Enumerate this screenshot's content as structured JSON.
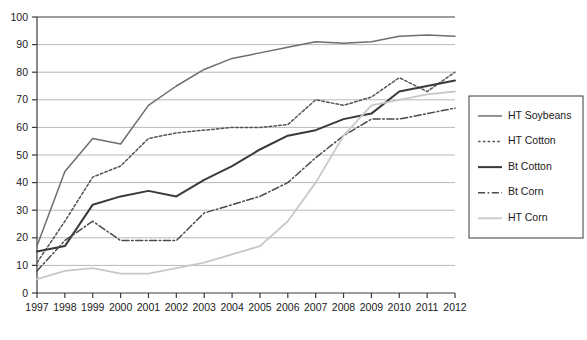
{
  "chart_data": {
    "type": "line",
    "title": "",
    "subtitle": "",
    "xlabel": "",
    "ylabel": "",
    "x": [
      1997,
      1998,
      1999,
      2000,
      2001,
      2002,
      2003,
      2004,
      2005,
      2006,
      2007,
      2008,
      2009,
      2010,
      2011,
      2012
    ],
    "xlim": [
      1997,
      2012
    ],
    "ylim": [
      0,
      100
    ],
    "y_ticks": [
      0,
      10,
      20,
      30,
      40,
      50,
      60,
      70,
      80,
      90,
      100
    ],
    "x_tick_labels": [
      "1997",
      "1998",
      "1999",
      "2000",
      "2001",
      "2002",
      "2003",
      "2004",
      "2005",
      "2006",
      "2007",
      "2008",
      "2009",
      "2010",
      "2011",
      "2012"
    ],
    "y_tick_labels": [
      "0",
      "10",
      "20",
      "30",
      "40",
      "50",
      "60",
      "70",
      "80",
      "90",
      "100"
    ],
    "grid": true,
    "grid_axis": "y",
    "legend_position": "right",
    "series": [
      {
        "name": "HT Soybeans",
        "style": "solid",
        "color": "#6e6e6e",
        "width": 1.5,
        "values": [
          17,
          44,
          56,
          54,
          68,
          75,
          81,
          85,
          87,
          89,
          91,
          90.5,
          91,
          93,
          93.5,
          93
        ]
      },
      {
        "name": "HT Cotton",
        "style": "dotted",
        "color": "#555555",
        "width": 1.5,
        "values": [
          11,
          26,
          42,
          46,
          56,
          58,
          59,
          60,
          60,
          61,
          70,
          68,
          71,
          78,
          73,
          80
        ]
      },
      {
        "name": "Bt Cotton",
        "style": "solid",
        "color": "#3a3a3a",
        "width": 2,
        "values": [
          15,
          17,
          32,
          35,
          37,
          35,
          41,
          46,
          52,
          57,
          59,
          63,
          65,
          73,
          75,
          77
        ]
      },
      {
        "name": "Bt Corn",
        "style": "dashdot",
        "color": "#4a4a4a",
        "width": 1.5,
        "values": [
          8,
          19,
          26,
          19,
          19,
          19,
          29,
          32,
          35,
          40,
          49,
          57,
          63,
          63,
          65,
          67
        ]
      },
      {
        "name": "HT Corn",
        "style": "solid",
        "color": "#c8c8c8",
        "width": 1.8,
        "values": [
          5,
          8,
          9,
          7,
          7,
          9,
          11,
          14,
          17,
          26,
          40,
          57,
          68,
          70,
          72,
          73
        ]
      }
    ]
  },
  "legend": {
    "items": [
      {
        "label": "HT Soybeans"
      },
      {
        "label": "HT Cotton"
      },
      {
        "label": "Bt Cotton"
      },
      {
        "label": "Bt Corn"
      },
      {
        "label": "HT Corn"
      }
    ]
  }
}
